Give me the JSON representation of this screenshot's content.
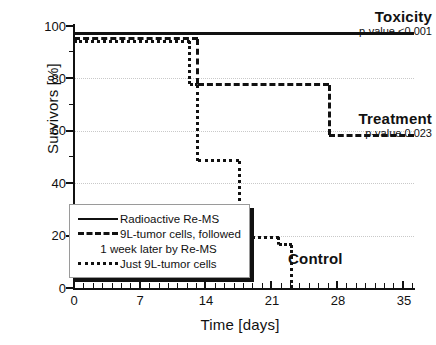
{
  "chart_data": {
    "type": "line",
    "title": "",
    "xlabel": "Time [days]",
    "ylabel": "Survivors [%]",
    "xlim": [
      0,
      36.2
    ],
    "ylim": [
      0,
      103
    ],
    "xticks": [
      0,
      7,
      14,
      21,
      28,
      35
    ],
    "yticks": [
      0,
      20,
      40,
      60,
      80,
      100
    ],
    "xtick_labels": [
      "0",
      "7",
      "14",
      "21",
      "28",
      "35"
    ],
    "ytick_labels": [
      "0",
      "20",
      "40",
      "60",
      "80",
      "100"
    ],
    "x_minor_step": 1,
    "y_minor_step": 10,
    "grid": "horizontal-dotted",
    "legend_position": "lower-left-inside",
    "series": [
      {
        "name": "Radioactive Re-MS",
        "style": "solid",
        "annotation": "Toxicity",
        "annotation_pvalue": "p-value <0.001",
        "steps_x": [
          0,
          36.2
        ],
        "steps_y": [
          100,
          100
        ]
      },
      {
        "name": "9L-tumor cells, followed 1 week later by Re-MS",
        "style": "dashed",
        "annotation": "Treatment",
        "annotation_pvalue": "p-value 0.023",
        "steps_x": [
          0,
          13.2,
          13.2,
          27.2,
          27.2,
          36.2
        ],
        "steps_y": [
          98,
          98,
          80,
          80,
          60,
          60
        ]
      },
      {
        "name": "Just 9L-tumor cells",
        "style": "dotted",
        "annotation": "Control",
        "annotation_pvalue": "",
        "steps_x": [
          0,
          12.3,
          12.3,
          13.2,
          13.2,
          17.6,
          17.6,
          21.8,
          21.8,
          23.2,
          23.2
        ],
        "steps_y": [
          97,
          97,
          80,
          80,
          50,
          50,
          20,
          20,
          17,
          17,
          0
        ]
      }
    ]
  },
  "legend": {
    "rows": [
      {
        "key": "solid",
        "label": "Radioactive Re-MS"
      },
      {
        "key": "dash",
        "label": "9L-tumor cells, followed"
      },
      {
        "key": "cont",
        "label": "1 week later by Re-MS"
      },
      {
        "key": "dot",
        "label": "Just 9L-tumor cells"
      }
    ]
  },
  "annotations": {
    "toxicity_label": "Toxicity",
    "toxicity_pvalue": "p-value <0.001",
    "treatment_label": "Treatment",
    "treatment_pvalue": "p-value 0.023",
    "control_label": "Control"
  }
}
